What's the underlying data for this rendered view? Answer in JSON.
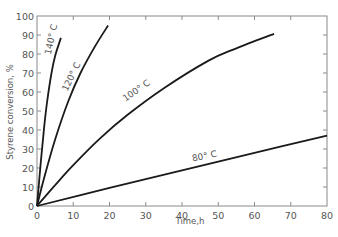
{
  "chart_data": {
    "type": "line",
    "title": "",
    "xlabel": "Time,h",
    "ylabel": "Styrene conversion, %",
    "xlim": [
      0,
      80
    ],
    "ylim": [
      0,
      100
    ],
    "x_ticks": [
      0,
      10,
      20,
      30,
      40,
      50,
      60,
      70,
      80
    ],
    "y_ticks": [
      0,
      10,
      20,
      30,
      40,
      50,
      60,
      70,
      80,
      90,
      100
    ],
    "grid": false,
    "legend": "inline labels on curves",
    "series": [
      {
        "name": "140° C",
        "x": [
          0,
          1,
          2,
          2.8,
          4,
          5,
          6.6
        ],
        "y": [
          0,
          22,
          42,
          55,
          70,
          79,
          88.5
        ]
      },
      {
        "name": "120° C",
        "x": [
          0,
          2,
          5,
          8.6,
          12,
          16,
          19.6
        ],
        "y": [
          0,
          15,
          35,
          55,
          70,
          84,
          95
        ]
      },
      {
        "name": "100° C",
        "x": [
          0,
          5,
          10,
          17.4,
          25,
          35,
          47.2,
          55,
          65.4
        ],
        "y": [
          0,
          11,
          21.5,
          35.6,
          48,
          62,
          76.4,
          83,
          90.6
        ]
      },
      {
        "name": "80° C",
        "x": [
          0,
          20,
          40,
          60,
          80
        ],
        "y": [
          0,
          9.5,
          18.8,
          28,
          37
        ]
      }
    ]
  }
}
